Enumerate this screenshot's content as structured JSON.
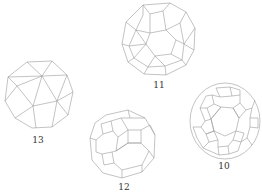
{
  "figure": {
    "polyhedra": [
      {
        "id": "13",
        "label": "13",
        "name": "snub-cube"
      },
      {
        "id": "11",
        "label": "11",
        "name": "snub-dodecahedron"
      },
      {
        "id": "12",
        "label": "12",
        "name": "truncated-cuboctahedron"
      },
      {
        "id": "10",
        "label": "10",
        "name": "truncated-icosidodecahedron"
      }
    ]
  },
  "colors": {
    "edge": "#9a9a9a",
    "label": "#333333",
    "background": "#ffffff"
  }
}
